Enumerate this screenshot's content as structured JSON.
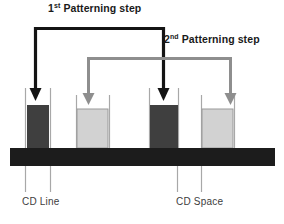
{
  "figure": {
    "title_absent": true,
    "background_color": "#ffffff"
  },
  "annotations": {
    "step1": {
      "number": "1",
      "ordinal_suffix": "st",
      "text": " Patterning step",
      "color": "#1a1a1a"
    },
    "step2": {
      "number": "2",
      "ordinal_suffix": "nd",
      "text": " Patterning step",
      "color": "#1a1a1a"
    }
  },
  "dimension_labels": {
    "cd_line": "CD Line",
    "cd_space": "CD Space"
  },
  "colors": {
    "dark_feature": "#3f3f3f",
    "light_feature": "#d2d2d2",
    "light_feature_border": "#9a9a9a",
    "substrate": "#1c1c1c",
    "arrow_step1": "#141414",
    "arrow_step2": "#8e8e8e",
    "guide_line": "#a8a8a8"
  },
  "features": [
    {
      "id": "feature-1",
      "type": "dark-line",
      "x": 27,
      "y": 105,
      "width": 22,
      "height": 43,
      "fill": "#3f3f3f",
      "pointed_by": "step1"
    },
    {
      "id": "feature-2",
      "type": "light-line",
      "x": 77,
      "y": 109,
      "width": 31,
      "height": 39,
      "fill": "#d2d2d2",
      "pointed_by": "step2"
    },
    {
      "id": "feature-3",
      "type": "dark-line",
      "x": 150,
      "y": 105,
      "width": 28,
      "height": 43,
      "fill": "#3f3f3f",
      "pointed_by": "step1"
    },
    {
      "id": "feature-4",
      "type": "light-line",
      "x": 202,
      "y": 109,
      "width": 31,
      "height": 39,
      "fill": "#d2d2d2",
      "pointed_by": "step2"
    }
  ],
  "substrate": {
    "x": 10,
    "y": 148,
    "width": 265,
    "height": 18,
    "fill": "#1c1c1c"
  },
  "guide_lines": {
    "cd_line_pair": [
      25,
      50
    ],
    "cd_space_pair": [
      177,
      202
    ]
  }
}
